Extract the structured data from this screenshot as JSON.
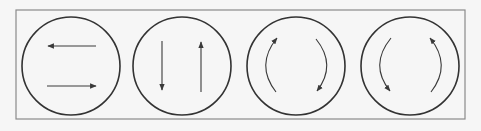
{
  "diagram": {
    "title": "",
    "background": "#f6f6f6",
    "frame": {
      "x": 16,
      "y": 10,
      "width": 449,
      "height": 109,
      "color": "#8a8a8a"
    },
    "circle_color": "#333333",
    "arrow_color": "#3a3a3a",
    "panels": [
      {
        "id": "panel-1",
        "description": "two horizontal antiparallel arrows",
        "center": [
          71,
          66
        ],
        "radius": 49,
        "arrows": [
          {
            "type": "line",
            "direction": "left",
            "from": [
              96,
              46
            ],
            "to": [
              48,
              46
            ]
          },
          {
            "type": "line",
            "direction": "right",
            "from": [
              47,
              86
            ],
            "to": [
              96,
              86
            ]
          }
        ]
      },
      {
        "id": "panel-2",
        "description": "two vertical antiparallel arrows",
        "center": [
          182,
          66
        ],
        "radius": 49,
        "arrows": [
          {
            "type": "line",
            "direction": "down",
            "from": [
              162,
              41
            ],
            "to": [
              162,
              90
            ]
          },
          {
            "type": "line",
            "direction": "up",
            "from": [
              201,
              92
            ],
            "to": [
              201,
              42
            ]
          }
        ]
      },
      {
        "id": "panel-3",
        "description": "two curved arrows indicating clockwise rotation",
        "center": [
          296,
          66
        ],
        "radius": 49,
        "rotation": "clockwise",
        "arrows": [
          {
            "type": "arc",
            "from": [
              276,
              92
            ],
            "control": [
              255,
              65
            ],
            "to": [
              277,
              38
            ]
          },
          {
            "type": "arc",
            "from": [
              316,
              39
            ],
            "control": [
              337,
              65
            ],
            "to": [
              317,
              91
            ]
          }
        ]
      },
      {
        "id": "panel-4",
        "description": "two curved arrows indicating counter-clockwise rotation",
        "center": [
          410,
          66
        ],
        "radius": 49,
        "rotation": "counter-clockwise",
        "arrows": [
          {
            "type": "arc",
            "from": [
              391,
              38
            ],
            "control": [
              369,
              65
            ],
            "to": [
              390,
              91
            ]
          },
          {
            "type": "arc",
            "from": [
              431,
              92
            ],
            "control": [
              452,
              65
            ],
            "to": [
              430,
              38
            ]
          }
        ]
      }
    ]
  }
}
